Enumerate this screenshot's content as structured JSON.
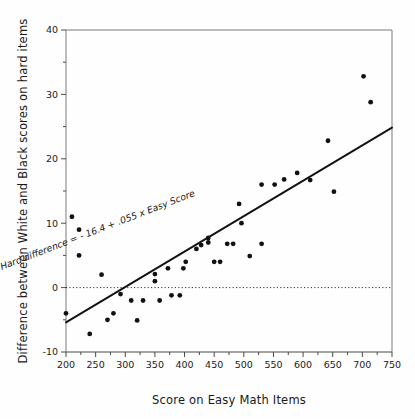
{
  "chart_data": {
    "type": "scatter",
    "title": "",
    "xlabel": "Score on Easy Math Items",
    "ylabel": "Difference between White and Black scores on hard items",
    "xlim": [
      200,
      750
    ],
    "ylim": [
      -10,
      40
    ],
    "xticks": [
      200,
      250,
      300,
      350,
      400,
      450,
      500,
      550,
      600,
      650,
      700,
      750
    ],
    "yticks": [
      -10,
      0,
      10,
      20,
      30,
      40
    ],
    "xminor_step": 25,
    "yminor_step": 5,
    "grid": false,
    "legend": null,
    "annotations": [
      {
        "text": "Hard difference = - 16.4 + .055 x Easy Score",
        "x": 255,
        "y": 8.5,
        "rotation": -21,
        "style": "italic"
      }
    ],
    "reference_lines": [
      {
        "name": "zero-line",
        "orientation": "horizontal",
        "value": 0,
        "style": "dotted",
        "color": "#1a1a1a"
      }
    ],
    "fit_line": {
      "name": "regression-line",
      "equation": "y = -16.4 + 0.055x",
      "intercept": -16.4,
      "slope": 0.055,
      "x_start": 200,
      "x_end": 750,
      "y_start": -5.4,
      "y_end": 24.85,
      "color": "#111111"
    },
    "series": [
      {
        "name": "observations",
        "marker": "filled-circle",
        "color": "#111111",
        "points": [
          [
            200,
            -4.0
          ],
          [
            210,
            11.0
          ],
          [
            222,
            9.0
          ],
          [
            222,
            5.0
          ],
          [
            240,
            -7.2
          ],
          [
            260,
            2.0
          ],
          [
            270,
            -5.0
          ],
          [
            280,
            -4.0
          ],
          [
            292,
            -1.0
          ],
          [
            310,
            -2.0
          ],
          [
            320,
            -5.1
          ],
          [
            330,
            -2.0
          ],
          [
            350,
            1.0
          ],
          [
            350,
            2.1
          ],
          [
            358,
            -2.0
          ],
          [
            372,
            3.0
          ],
          [
            378,
            -1.2
          ],
          [
            392,
            -1.2
          ],
          [
            398,
            3.0
          ],
          [
            402,
            4.0
          ],
          [
            420,
            6.0
          ],
          [
            428,
            6.6
          ],
          [
            440,
            7.7
          ],
          [
            440,
            7.0
          ],
          [
            450,
            4.0
          ],
          [
            460,
            4.0
          ],
          [
            472,
            6.8
          ],
          [
            482,
            6.8
          ],
          [
            492,
            13.0
          ],
          [
            496,
            10.0
          ],
          [
            510,
            4.9
          ],
          [
            530,
            6.8
          ],
          [
            530,
            16.0
          ],
          [
            552,
            16.0
          ],
          [
            568,
            16.8
          ],
          [
            590,
            17.8
          ],
          [
            612,
            16.7
          ],
          [
            642,
            22.8
          ],
          [
            652,
            14.9
          ],
          [
            702,
            32.8
          ],
          [
            714,
            28.8
          ]
        ]
      }
    ]
  }
}
